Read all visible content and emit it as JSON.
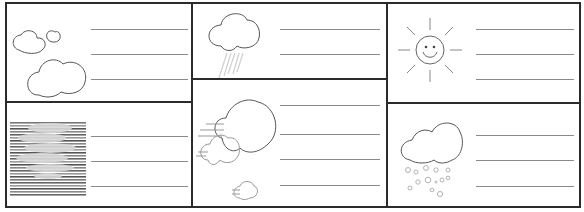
{
  "worksheet": {
    "title": "",
    "line_color": "#8a8a8a",
    "border_color": "#2b2b2b",
    "cells": [
      {
        "id": "partly-cloudy",
        "icon": "clouds-icon",
        "write_lines": 3
      },
      {
        "id": "rain",
        "icon": "rain-cloud-icon",
        "write_lines": 2
      },
      {
        "id": "sunny",
        "icon": "smiling-sun-icon",
        "write_lines": 3
      },
      {
        "id": "fog",
        "icon": "fog-icon",
        "write_lines": 3
      },
      {
        "id": "windy",
        "icon": "windy-clouds-icon",
        "write_lines": 4
      },
      {
        "id": "hail",
        "icon": "hail-cloud-icon",
        "write_lines": 3
      }
    ]
  }
}
